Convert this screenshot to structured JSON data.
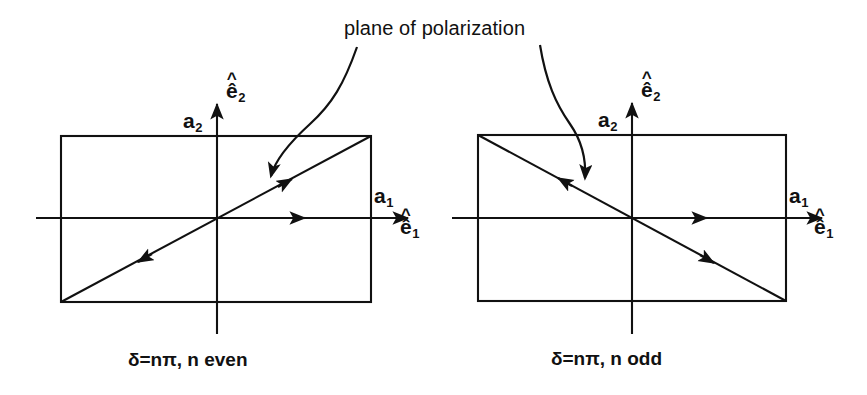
{
  "figure": {
    "title_annotation": "plane of polarization",
    "background_color": "#ffffff",
    "stroke_color": "#111111"
  },
  "panels": [
    {
      "id": "left",
      "caption": "δ=nπ, n even",
      "parity": "even",
      "slope_sign": "positive",
      "axes": {
        "x_axis_label": "ê",
        "x_axis_sub": "1",
        "y_axis_label": "ê",
        "y_axis_sub": "2",
        "x_amplitude_label": "a",
        "x_amplitude_sub": "1",
        "y_amplitude_label": "a",
        "y_amplitude_sub": "2"
      }
    },
    {
      "id": "right",
      "caption": "δ=nπ, n odd",
      "parity": "odd",
      "slope_sign": "negative",
      "axes": {
        "x_axis_label": "ê",
        "x_axis_sub": "1",
        "y_axis_label": "ê",
        "y_axis_sub": "2",
        "x_amplitude_label": "a",
        "x_amplitude_sub": "1",
        "y_amplitude_label": "a",
        "y_amplitude_sub": "2"
      }
    }
  ]
}
